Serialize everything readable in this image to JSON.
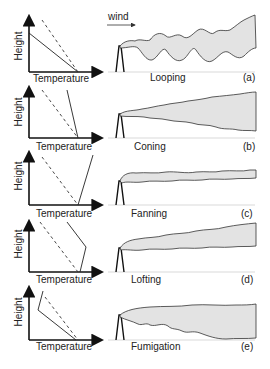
{
  "figure": {
    "wind_label": "wind",
    "x_axis_label": "Temperature",
    "y_axis_label": "Height",
    "colors": {
      "plume_fill": "#e3e3e3",
      "plume_outline": "#333333",
      "axes": "#111111"
    },
    "line_legend": {
      "solid": "environmental lapse rate",
      "dashed": "dry adiabatic lapse rate"
    },
    "panels": [
      {
        "id": "a",
        "letter": "(a)",
        "name": "Looping"
      },
      {
        "id": "b",
        "letter": "(b)",
        "name": "Coning"
      },
      {
        "id": "c",
        "letter": "(c)",
        "name": "Fanning"
      },
      {
        "id": "d",
        "letter": "(d)",
        "name": "Lofting"
      },
      {
        "id": "e",
        "letter": "(e)",
        "name": "Fumigation"
      }
    ]
  }
}
